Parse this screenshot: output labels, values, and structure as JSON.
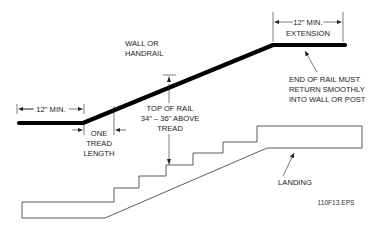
{
  "diagram": {
    "type": "handrail-stair-elevation",
    "labels": {
      "wall_or_handrail": [
        "WALL OR",
        "HANDRAIL"
      ],
      "left_extension": "12\" MIN.",
      "top_extension": [
        "12\" MIN.",
        "EXTENSION"
      ],
      "end_of_rail": [
        "END OF RAIL MUST",
        "RETURN SMOOTHLY",
        "INTO WALL OR POST"
      ],
      "top_of_rail": [
        "TOP OF RAIL",
        "34\" – 36\" ABOVE",
        "TREAD"
      ],
      "one_tread_length": [
        "ONE",
        "TREAD",
        "LENGTH"
      ],
      "landing": "LANDING",
      "figure_id": "110F13.EPS"
    },
    "colors": {
      "rail": "#000000",
      "line": "#333333",
      "text": "#1a1a1a",
      "background": "#ffffff"
    }
  }
}
